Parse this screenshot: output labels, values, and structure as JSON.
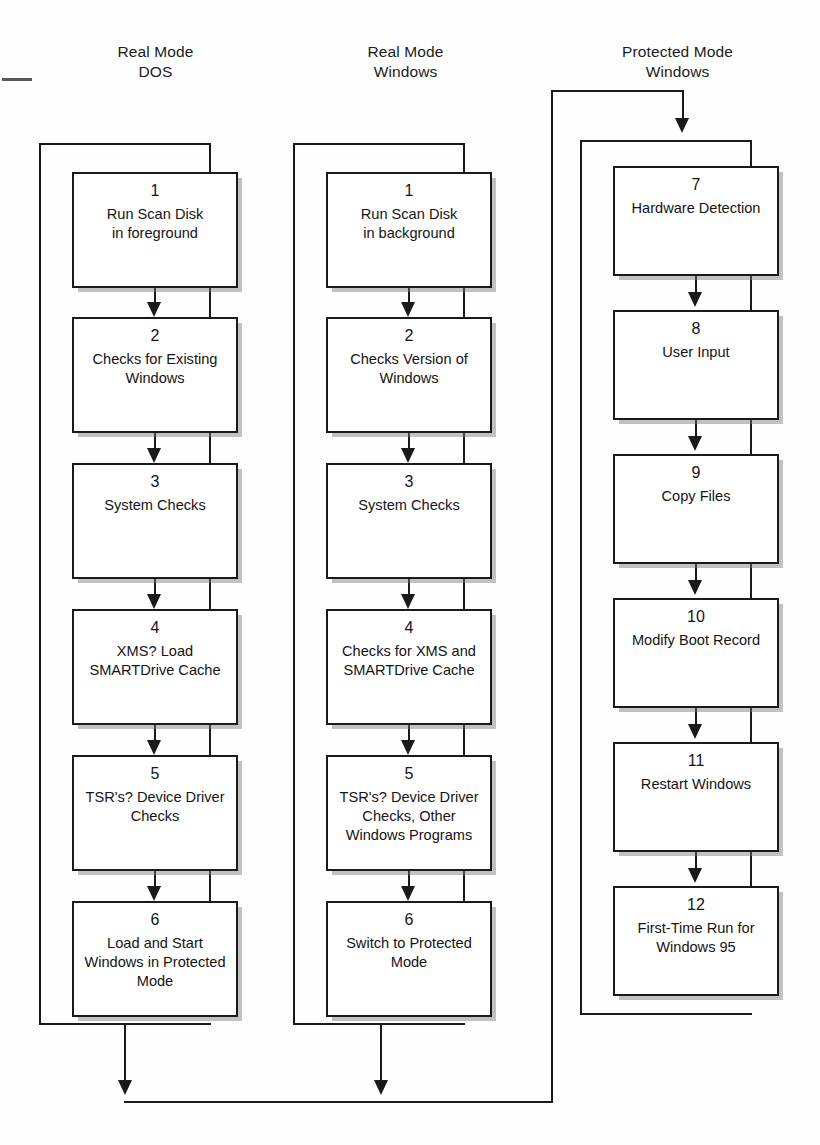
{
  "diagram": {
    "columns": [
      {
        "id": "real-mode-dos",
        "header": "Real Mode\nDOS",
        "nodes": [
          {
            "num": "1",
            "label": "Run Scan Disk\nin foreground"
          },
          {
            "num": "2",
            "label": "Checks for Existing\nWindows"
          },
          {
            "num": "3",
            "label": "System Checks"
          },
          {
            "num": "4",
            "label": "XMS? Load\nSMARTDrive Cache"
          },
          {
            "num": "5",
            "label": "TSR's? Device Driver\nChecks"
          },
          {
            "num": "6",
            "label": "Load and Start\nWindows in Protected\nMode"
          }
        ]
      },
      {
        "id": "real-mode-windows",
        "header": "Real Mode\nWindows",
        "nodes": [
          {
            "num": "1",
            "label": "Run Scan Disk\nin background"
          },
          {
            "num": "2",
            "label": "Checks Version of\nWindows"
          },
          {
            "num": "3",
            "label": "System Checks"
          },
          {
            "num": "4",
            "label": "Checks for XMS and\nSMARTDrive Cache"
          },
          {
            "num": "5",
            "label": "TSR's? Device Driver\nChecks, Other\nWindows Programs"
          },
          {
            "num": "6",
            "label": "Switch to Protected\nMode"
          }
        ]
      },
      {
        "id": "protected-mode-windows",
        "header": "Protected Mode\nWindows",
        "nodes": [
          {
            "num": "7",
            "label": "Hardware Detection"
          },
          {
            "num": "8",
            "label": "User Input"
          },
          {
            "num": "9",
            "label": "Copy Files"
          },
          {
            "num": "10",
            "label": "Modify Boot Record"
          },
          {
            "num": "11",
            "label": "Restart Windows"
          },
          {
            "num": "12",
            "label": "First-Time Run for\nWindows 95"
          }
        ]
      }
    ],
    "colors": {
      "stroke": "#1a1a1a",
      "fill": "#ffffff",
      "shadow": "#787878",
      "background": "#fefefe"
    }
  }
}
